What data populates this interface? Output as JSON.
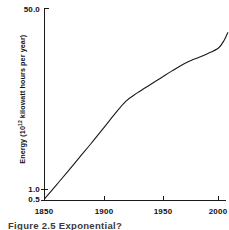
{
  "figure": {
    "caption": "Figure 2.5  Exponential?",
    "background_color": "#ffffff",
    "line_color": "#1a1a1a",
    "text_color": "#111111"
  },
  "axes": {
    "ylabel_main": "Energy (10",
    "ylabel_exponent": "12",
    "ylabel_tail": " kilowatt hours per year)",
    "ylabel_full": "Energy (10¹² kilowatt hours per year)",
    "xlabel": "",
    "yticks": [
      "50.0",
      "1.0",
      "0.5"
    ],
    "xticks": [
      "1850",
      "1900",
      "1950",
      "2000"
    ]
  },
  "chart_data": {
    "type": "line",
    "title": "",
    "xlabel": "",
    "ylabel": "Energy (10¹² kilowatt hours per year)",
    "xlim": [
      1850,
      2008
    ],
    "ylim": [
      0.5,
      50.0
    ],
    "yscale": "log",
    "grid": false,
    "legend": null,
    "xtick_values": [
      1850,
      1900,
      1950,
      2000
    ],
    "xtick_labels": [
      "1850",
      "1900",
      "1950",
      "2000"
    ],
    "ytick_values": [
      0.5,
      1.0,
      50.0
    ],
    "ytick_labels": [
      "0.5",
      "1.0",
      "50.0"
    ],
    "series": [
      {
        "name": "World energy consumption",
        "x": [
          1850,
          1860,
          1870,
          1880,
          1890,
          1900,
          1910,
          1920,
          1930,
          1940,
          1950,
          1960,
          1970,
          1980,
          1990,
          2000,
          2005,
          2008
        ],
        "y": [
          0.52,
          0.72,
          1.0,
          1.4,
          1.95,
          2.75,
          3.9,
          5.4,
          6.6,
          7.9,
          9.4,
          11.2,
          13.2,
          15.0,
          16.8,
          19.4,
          23.5,
          28.0
        ]
      }
    ]
  }
}
